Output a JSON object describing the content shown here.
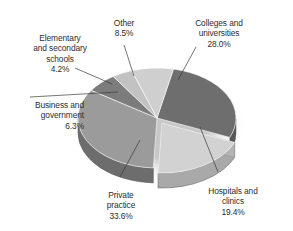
{
  "chart_data": {
    "type": "pie",
    "title": "",
    "style": "3d-pie-exploded",
    "legend_position": "none",
    "labels_outside": true,
    "categories": [
      "Colleges and universities",
      "Hospitals and clinics",
      "Private practice",
      "Business and government",
      "Elementary and secondary schools",
      "Other"
    ],
    "values": [
      28.0,
      19.4,
      33.6,
      6.3,
      4.2,
      8.5
    ],
    "units": "%",
    "slices": [
      {
        "name": "Colleges and universities",
        "label": "Colleges and\nuniversities",
        "value": 28.0,
        "percent_text": "28.0%",
        "color": "#6e6e6e",
        "side_color": "#565656",
        "exploded": false
      },
      {
        "name": "Hospitals and clinics",
        "label": "Hospitals and\nclinics",
        "value": 19.4,
        "percent_text": "19.4%",
        "color": "#d2d2d2",
        "side_color": "#a9a9a9",
        "exploded": true
      },
      {
        "name": "Private practice",
        "label": "Private\npractice",
        "value": 33.6,
        "percent_text": "33.6%",
        "color": "#9b9b9b",
        "side_color": "#6d6d6d",
        "exploded": false
      },
      {
        "name": "Business and government",
        "label": "Business and\ngovernment",
        "value": 6.3,
        "percent_text": "6.3%",
        "color": "#7c7c7c",
        "side_color": "#5e5e5e",
        "exploded": false
      },
      {
        "name": "Elementary and secondary schools",
        "label": "Elementary\nand secondary\nschools",
        "value": 4.2,
        "percent_text": "4.2%",
        "color": "#c2c2c2",
        "side_color": "#8f8f8f",
        "exploded": false
      },
      {
        "name": "Other",
        "label": "Other",
        "value": 8.5,
        "percent_text": "8.5%",
        "color": "#cfcfcf",
        "side_color": "#a0a0a0",
        "exploded": false
      }
    ],
    "background_color": "#ffffff",
    "text_color": "#2e2e2e",
    "leader_line_color": "#3a3a3a"
  }
}
